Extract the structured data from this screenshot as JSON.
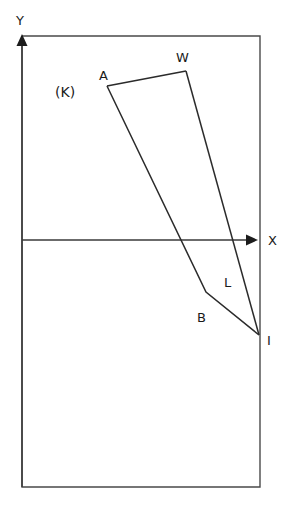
{
  "figure": {
    "title": "",
    "region_label": "(K)",
    "background_color": "#ffffff",
    "line_color": "#2b2b2b",
    "frame_color": "#4a4a4a"
  },
  "axes": {
    "x_label": "X",
    "y_label": "Y",
    "origin": {
      "x": 22,
      "y": 240
    },
    "x_axis": {
      "from_x": 22,
      "to_x": 256,
      "y": 240,
      "arrow": "right"
    },
    "y_axis": {
      "x": 22,
      "from_y": 487,
      "to_y": 38,
      "arrow": "up"
    }
  },
  "frame": {
    "left": 22,
    "top": 36,
    "right": 260,
    "bottom": 487
  },
  "points": [
    {
      "name": "A",
      "label": "A",
      "x": 107,
      "y": 86,
      "label_x": 99,
      "label_y": 80
    },
    {
      "name": "W",
      "label": "W",
      "x": 186,
      "y": 71,
      "label_x": 178,
      "label_y": 63
    },
    {
      "name": "B",
      "label": "B",
      "x": 206,
      "y": 292,
      "label_x": 198,
      "label_y": 322
    },
    {
      "name": "L",
      "label": "L",
      "x": 228,
      "y": 273,
      "label_x": 226,
      "label_y": 285
    },
    {
      "name": "I",
      "label": "I",
      "x": 259,
      "y": 335,
      "label_x": 268,
      "label_y": 344
    }
  ],
  "edges": [
    {
      "name": "edge-A-W",
      "from": "A",
      "to": "W"
    },
    {
      "name": "edge-A-B",
      "from": "A",
      "to": "B"
    },
    {
      "name": "edge-B-I",
      "from": "B",
      "to": "I"
    },
    {
      "name": "edge-W-I",
      "from": "W",
      "to": "I"
    }
  ],
  "paths": {
    "polyline_AW": "107,86 186,71",
    "polyline_ABI": "107,86 206,292 259,335",
    "polyline_WI": "186,71 259,335",
    "frame_rect": "22,36 260,36 260,487 22,487 22,36",
    "x_axis_path": "22,240 252,240",
    "y_axis_path": "22,487 22,42"
  }
}
